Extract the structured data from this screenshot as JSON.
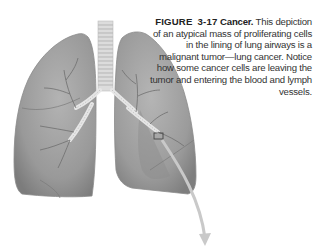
{
  "figure": {
    "label": "FIGURE",
    "number": "3-17",
    "title": "Cancer.",
    "body": "This depiction of an atypical mass of proliferating cells in the lining of lung airways is a malignant tumor—lung cancer. Notice how some cancer cells are leaving the tumor and entering the blood and lymph vessels."
  },
  "illustration": {
    "subject": "lungs-with-tumor",
    "lung_color": "#9a9a9a",
    "lung_shadow": "#7d7d7d",
    "trachea_color": "#d8d8d8",
    "airway_color": "#6f6f6f",
    "arrow_color": "#c8c8c8"
  }
}
